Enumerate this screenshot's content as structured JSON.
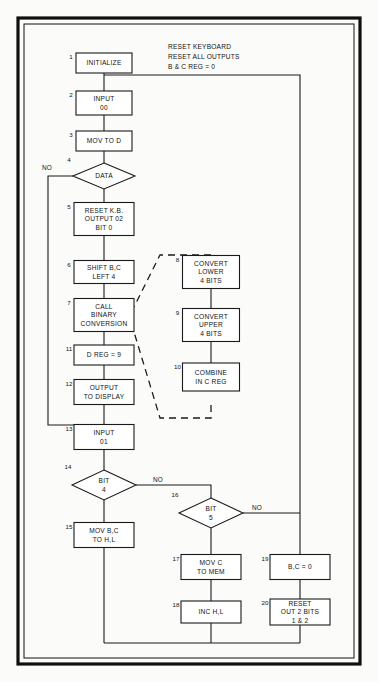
{
  "document": {
    "title": "Keyboard Data Entry Flowchart",
    "note": {
      "lines": [
        "RESET KEYBOARD",
        "RESET ALL OUTPUTS",
        "B & C REG = 0"
      ]
    }
  },
  "colors": {
    "line": "#1a1a1a",
    "frame": "#101010",
    "shape_fill": "#ffffff",
    "page_background": "#fbfbfa"
  },
  "nodes": [
    {
      "id": "n1",
      "num": "1",
      "shape": "process",
      "lines": [
        "INITIALIZE"
      ],
      "x": 104,
      "y": 63,
      "w": 56,
      "h": 20
    },
    {
      "id": "n2",
      "num": "2",
      "shape": "process",
      "lines": [
        "INPUT",
        "00"
      ],
      "x": 104,
      "y": 103,
      "w": 56,
      "h": 24
    },
    {
      "id": "n3",
      "num": "3",
      "shape": "process",
      "lines": [
        "MOV TO D"
      ],
      "x": 104,
      "y": 141,
      "w": 56,
      "h": 20
    },
    {
      "id": "n4",
      "num": "4",
      "shape": "decision",
      "lines": [
        "DATA"
      ],
      "x": 104,
      "y": 176,
      "w": 62,
      "h": 26
    },
    {
      "id": "n5",
      "num": "5",
      "shape": "process",
      "lines": [
        "RESET K.B.",
        "OUTPUT 02",
        "BIT 0"
      ],
      "x": 104,
      "y": 219,
      "w": 60,
      "h": 33
    },
    {
      "id": "n6",
      "num": "6",
      "shape": "process",
      "lines": [
        "SHIFT B,C",
        "LEFT 4"
      ],
      "x": 104,
      "y": 272,
      "w": 60,
      "h": 23
    },
    {
      "id": "n7",
      "num": "7",
      "shape": "process",
      "lines": [
        "CALL",
        "BINARY",
        "CONVERSION"
      ],
      "x": 104,
      "y": 315,
      "w": 60,
      "h": 33
    },
    {
      "id": "n11",
      "num": "11",
      "shape": "process",
      "lines": [
        "D REG = 9"
      ],
      "x": 104,
      "y": 355,
      "w": 60,
      "h": 20
    },
    {
      "id": "n12",
      "num": "12",
      "shape": "process",
      "lines": [
        "OUTPUT",
        "TO DISPLAY"
      ],
      "x": 104,
      "y": 392,
      "w": 60,
      "h": 25
    },
    {
      "id": "n13",
      "num": "13",
      "shape": "process",
      "lines": [
        "INPUT",
        "01"
      ],
      "x": 104,
      "y": 437,
      "w": 60,
      "h": 25
    },
    {
      "id": "n14",
      "num": "14",
      "shape": "decision",
      "lines": [
        "BIT",
        "4"
      ],
      "x": 104,
      "y": 485,
      "w": 64,
      "h": 30
    },
    {
      "id": "n15",
      "num": "15",
      "shape": "process",
      "lines": [
        "MOV B,C",
        "TO H,L"
      ],
      "x": 104,
      "y": 535,
      "w": 60,
      "h": 25
    },
    {
      "id": "n8",
      "num": "8",
      "shape": "process",
      "lines": [
        "CONVERT",
        "LOWER",
        "4 BITS"
      ],
      "x": 211,
      "y": 272,
      "w": 57,
      "h": 33
    },
    {
      "id": "n9",
      "num": "9",
      "shape": "process",
      "lines": [
        "CONVERT",
        "UPPER",
        "4 BITS"
      ],
      "x": 211,
      "y": 325,
      "w": 57,
      "h": 33
    },
    {
      "id": "n10",
      "num": "10",
      "shape": "process",
      "lines": [
        "COMBINE",
        "IN C REG"
      ],
      "x": 211,
      "y": 377,
      "w": 57,
      "h": 28
    },
    {
      "id": "n16",
      "num": "16",
      "shape": "decision",
      "lines": [
        "BIT",
        "5"
      ],
      "x": 211,
      "y": 513,
      "w": 64,
      "h": 30
    },
    {
      "id": "n17",
      "num": "17",
      "shape": "process",
      "lines": [
        "MOV C",
        "TO MEM"
      ],
      "x": 211,
      "y": 567,
      "w": 60,
      "h": 25
    },
    {
      "id": "n18",
      "num": "18",
      "shape": "process",
      "lines": [
        "INC H,L"
      ],
      "x": 211,
      "y": 612,
      "w": 60,
      "h": 22
    },
    {
      "id": "n19",
      "num": "19",
      "shape": "process",
      "lines": [
        "B,C = 0"
      ],
      "x": 300,
      "y": 567,
      "w": 60,
      "h": 25
    },
    {
      "id": "n20",
      "num": "20",
      "shape": "process",
      "lines": [
        "RESET",
        "OUT 2 BITS",
        "1 & 2"
      ],
      "x": 300,
      "y": 612,
      "w": 60,
      "h": 26
    }
  ],
  "branch_labels": [
    {
      "id": "b1",
      "text": "NO",
      "x": 47,
      "y": 170
    },
    {
      "id": "b2",
      "text": "NO",
      "x": 158,
      "y": 482
    },
    {
      "id": "b3",
      "text": "NO",
      "x": 257,
      "y": 510
    }
  ]
}
